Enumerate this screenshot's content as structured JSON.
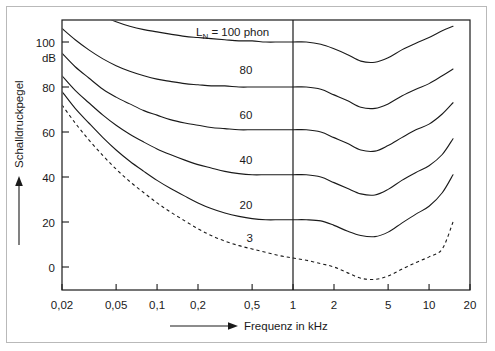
{
  "figure": {
    "background_color": "#ffffff",
    "frame_color": "#b9b9b9",
    "ink_color": "#1a1a1a"
  },
  "axes": {
    "x_title": "Frequenz in kHz",
    "y_title": "Schalldruckpegel",
    "y_unit": "dB",
    "x_ticks": [
      "0,02",
      "0,05",
      "0,1",
      "0,2",
      "0,5",
      "1",
      "2",
      "5",
      "10",
      "20"
    ],
    "x_tick_values": [
      0.02,
      0.05,
      0.1,
      0.2,
      0.5,
      1,
      2,
      5,
      10,
      20
    ],
    "y_ticks": [
      "0",
      "20",
      "40",
      "60",
      "80",
      "100"
    ],
    "y_tick_values": [
      0,
      20,
      40,
      60,
      80,
      100
    ]
  },
  "annotations": {
    "top_label_prefix": "L",
    "top_label_sub": "N",
    "top_label_rest": " = 100 phon",
    "reference_line_value": 1
  },
  "chart_data": {
    "type": "line",
    "title": "",
    "xlabel": "Frequenz in kHz",
    "ylabel": "Schalldruckpegel",
    "xlim": [
      0.02,
      20
    ],
    "ylim": [
      -10,
      113
    ],
    "xscale": "log",
    "grid": false,
    "legend": "inline-curve-labels",
    "x": [
      0.02,
      0.025,
      0.0315,
      0.04,
      0.05,
      0.063,
      0.08,
      0.1,
      0.125,
      0.16,
      0.2,
      0.25,
      0.315,
      0.4,
      0.5,
      0.63,
      0.8,
      1,
      1.25,
      1.6,
      2,
      2.5,
      3.15,
      4,
      5,
      6.3,
      8,
      10,
      12.5,
      15
    ],
    "series": [
      {
        "name": "100 phon",
        "label": "LN = 100 phon",
        "style": "solid",
        "values": [
          122,
          118,
          114.5,
          111.5,
          109,
          107,
          105.5,
          104.5,
          103.5,
          102.5,
          102,
          101.5,
          101,
          100.5,
          100.5,
          100,
          100,
          100,
          100,
          99,
          97,
          94.5,
          91.5,
          91,
          93,
          96.5,
          99.5,
          102,
          105,
          107
        ]
      },
      {
        "name": "80 phon",
        "label": "80",
        "style": "solid",
        "values": [
          106,
          101,
          96.5,
          92.5,
          89.5,
          87,
          85,
          83.5,
          82.5,
          81.5,
          81,
          80.5,
          80.5,
          80,
          80,
          80,
          80,
          80,
          80,
          79,
          76.5,
          74,
          71,
          70.5,
          72.5,
          76,
          79,
          81.5,
          85,
          88
        ]
      },
      {
        "name": "60 phon",
        "label": "60",
        "style": "solid",
        "values": [
          95,
          89,
          84,
          79,
          75.5,
          72.5,
          69.5,
          67.5,
          65.5,
          64,
          63,
          62,
          61.5,
          61,
          61,
          61,
          61,
          61,
          61,
          60,
          57.5,
          55,
          52,
          51.5,
          54,
          57.5,
          61,
          63.5,
          68,
          73
        ]
      },
      {
        "name": "40 phon",
        "label": "40",
        "style": "solid",
        "values": [
          85,
          78.5,
          73,
          67.5,
          63,
          59,
          55.5,
          52.5,
          50,
          47.5,
          45.5,
          44,
          42.5,
          41.5,
          41,
          41,
          41,
          41,
          41,
          40,
          37.5,
          35,
          32.5,
          32,
          34.5,
          38.5,
          42,
          45,
          50,
          57
        ]
      },
      {
        "name": "20 phon",
        "label": "20",
        "style": "solid",
        "values": [
          78,
          70.5,
          64,
          57.5,
          52,
          47,
          42.5,
          38.5,
          35,
          31.5,
          28.5,
          26,
          24,
          22.5,
          21.5,
          21,
          21,
          21,
          21,
          20.5,
          18.5,
          16,
          14,
          13.5,
          15.5,
          19.5,
          23.5,
          27,
          33,
          41
        ]
      },
      {
        "name": "3 phon (Hörschwelle)",
        "label": "3",
        "style": "dashed",
        "values": [
          72,
          64,
          56.5,
          49.5,
          43.5,
          38,
          33,
          28.5,
          24.5,
          20.5,
          17,
          14,
          11.5,
          9.5,
          8,
          6.5,
          5,
          4,
          3,
          1.5,
          0,
          -2.5,
          -5,
          -5.5,
          -4,
          -1,
          2,
          4.5,
          8,
          20
        ]
      }
    ],
    "curve_labels": [
      {
        "text": "3",
        "x": 0.48,
        "y": 11
      },
      {
        "text": "20",
        "x": 0.45,
        "y": 26
      },
      {
        "text": "40",
        "x": 0.45,
        "y": 46
      },
      {
        "text": "60",
        "x": 0.45,
        "y": 66
      },
      {
        "text": "80",
        "x": 0.45,
        "y": 86
      },
      {
        "text": "LN = 100 phon",
        "x": 0.33,
        "y": 107
      }
    ]
  }
}
